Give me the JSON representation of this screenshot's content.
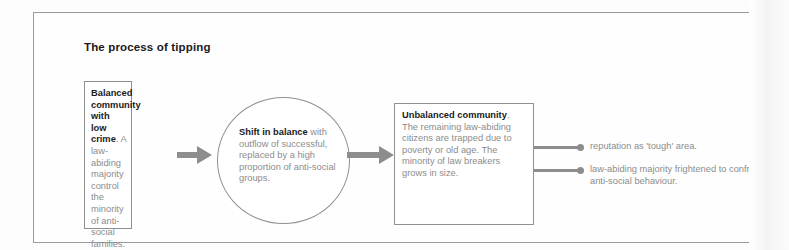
{
  "figure": {
    "title": "The process of tipping",
    "nodes": [
      {
        "id": "balanced-community",
        "shape": "rectangle",
        "bold_lead": "Balanced community with low crime",
        "body": ". A law-abiding majority control the minority of anti-social families."
      },
      {
        "id": "shift-in-balance",
        "shape": "ellipse",
        "bold_lead": "Shift in balance",
        "body": " with outflow of successful, replaced by a high proportion of anti-social groups."
      },
      {
        "id": "unbalanced-community",
        "shape": "rectangle",
        "bold_lead": "Unbalanced community",
        "body": ". The remaining law-abiding citizens are trapped due to poverty or old age. The minority of law breakers grows in size."
      }
    ],
    "arrows": [
      {
        "id": "arrow-1",
        "from": "balanced-community",
        "to": "shift-in-balance",
        "style": "block-arrow"
      },
      {
        "id": "arrow-2",
        "from": "shift-in-balance",
        "to": "unbalanced-community",
        "style": "block-arrow"
      }
    ],
    "outcomes": [
      {
        "id": "outcome-1",
        "text": "reputation as 'tough' area."
      },
      {
        "id": "outcome-2",
        "text": "law-abiding majority frightened to confront anti-social behaviour."
      }
    ],
    "colors": {
      "frame_border": "#9a9a9a",
      "shape_border": "#8f8f8f",
      "arrow_gray": "#8d8d8d",
      "body_text": "#8c8c8c",
      "bold_text": "#1a1a1a",
      "page_background": "#fdfdfd"
    }
  }
}
